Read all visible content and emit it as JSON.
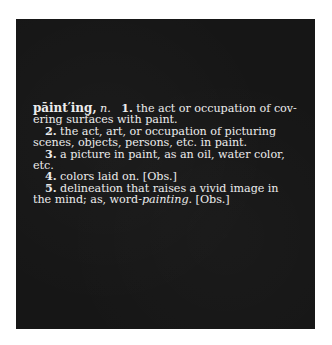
{
  "artwork": {
    "background_color": "#161616",
    "text_color": "#ececec"
  },
  "definition": {
    "headword": "pāint′ing,",
    "pos": "n.",
    "senses": [
      {
        "number": "1.",
        "lines": [
          "the act or occupation of cov-",
          "ering surfaces with paint."
        ]
      },
      {
        "number": "2.",
        "lines": [
          "the act, art, or occupation of picturing",
          "scenes, objects, persons, etc. in paint."
        ]
      },
      {
        "number": "3.",
        "lines": [
          "a picture in paint, as an oil, water color,",
          "etc."
        ]
      },
      {
        "number": "4.",
        "lines": [
          "colors laid on. [Obs.]"
        ]
      },
      {
        "number": "5.",
        "line1": "delineation that raises a vivid image in",
        "line2_prefix": "the mind; as, word-",
        "line2_italic": "painting",
        "line2_suffix": ". [Obs.]"
      }
    ]
  }
}
